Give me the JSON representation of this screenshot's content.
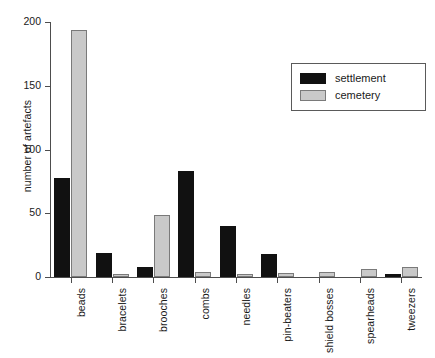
{
  "chart_data": {
    "type": "bar",
    "title": "",
    "subtitle": "",
    "xlabel": "",
    "ylabel": "number of artefacts",
    "ylim": [
      0,
      200
    ],
    "yticks": [
      0,
      50,
      100,
      150,
      200
    ],
    "ytick_labels": [
      "0",
      "50",
      "100",
      "150",
      "200"
    ],
    "grid": false,
    "legend_position": "top-right",
    "categories": [
      "beads",
      "bracelets",
      "brooches",
      "combs",
      "needles",
      "pin-beaters",
      "shield bosses",
      "spearheads",
      "tweezers"
    ],
    "series": [
      {
        "name": "settlement",
        "color": "#111111",
        "values": [
          78,
          19,
          8,
          83,
          40,
          18,
          0,
          0,
          2
        ]
      },
      {
        "name": "cemetery",
        "color": "#c9c9c9",
        "values": [
          194,
          2,
          49,
          4,
          2,
          3,
          4,
          6,
          8
        ]
      }
    ]
  },
  "legend": {
    "entries": [
      {
        "label": "settlement",
        "swatch": "settlement"
      },
      {
        "label": "cemetery",
        "swatch": "cemetery"
      }
    ]
  },
  "axis": {
    "y_axis_title": "number of artefacts"
  }
}
